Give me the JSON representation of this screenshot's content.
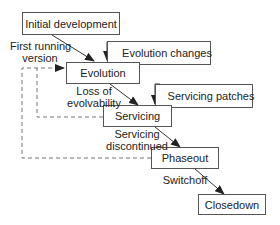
{
  "diagram": {
    "stages": {
      "initial_development": "Initial development",
      "evolution": "Evolution",
      "servicing": "Servicing",
      "phaseout": "Phaseout",
      "closedown": "Closedown"
    },
    "feedback": {
      "evolution_changes": "Evolution changes",
      "servicing_patches": "Servicing patches"
    },
    "transitions": {
      "first_running_version_1": "First running",
      "first_running_version_2": "version",
      "loss_of_evolvability_1": "Loss of",
      "loss_of_evolvability_2": "evolvability",
      "servicing_discontinued_1": "Servicing",
      "servicing_discontinued_2": "discontinued",
      "switchoff": "Switchoff"
    },
    "colors": {
      "line": "#333333",
      "box_border": "#555555",
      "dashed": "#777777"
    }
  }
}
